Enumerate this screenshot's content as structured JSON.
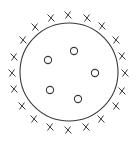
{
  "diagram": {
    "stroke_color": "#3a3a3a",
    "background": "#ffffff",
    "boundary_circle": {
      "cx": 69,
      "cy": 72,
      "r": 49
    },
    "inner_markers": {
      "symbol": "O",
      "count": 5,
      "radius": 3.6,
      "points": [
        {
          "x": 48,
          "y": 60
        },
        {
          "x": 74,
          "y": 51
        },
        {
          "x": 95,
          "y": 73
        },
        {
          "x": 50,
          "y": 90
        },
        {
          "x": 78,
          "y": 99
        }
      ]
    },
    "outer_markers": {
      "symbol": "X",
      "count": 20,
      "size": 3.2,
      "points": [
        {
          "x": 68,
          "y": 15
        },
        {
          "x": 87,
          "y": 18
        },
        {
          "x": 102,
          "y": 26
        },
        {
          "x": 116,
          "y": 40
        },
        {
          "x": 122,
          "y": 56
        },
        {
          "x": 125,
          "y": 73
        },
        {
          "x": 122,
          "y": 91
        },
        {
          "x": 116,
          "y": 106
        },
        {
          "x": 101,
          "y": 119
        },
        {
          "x": 86,
          "y": 127
        },
        {
          "x": 68,
          "y": 130
        },
        {
          "x": 50,
          "y": 127
        },
        {
          "x": 34,
          "y": 119
        },
        {
          "x": 22,
          "y": 106
        },
        {
          "x": 14,
          "y": 89
        },
        {
          "x": 12,
          "y": 73
        },
        {
          "x": 14,
          "y": 57
        },
        {
          "x": 23,
          "y": 40
        },
        {
          "x": 35,
          "y": 27
        },
        {
          "x": 51,
          "y": 18
        }
      ]
    }
  }
}
